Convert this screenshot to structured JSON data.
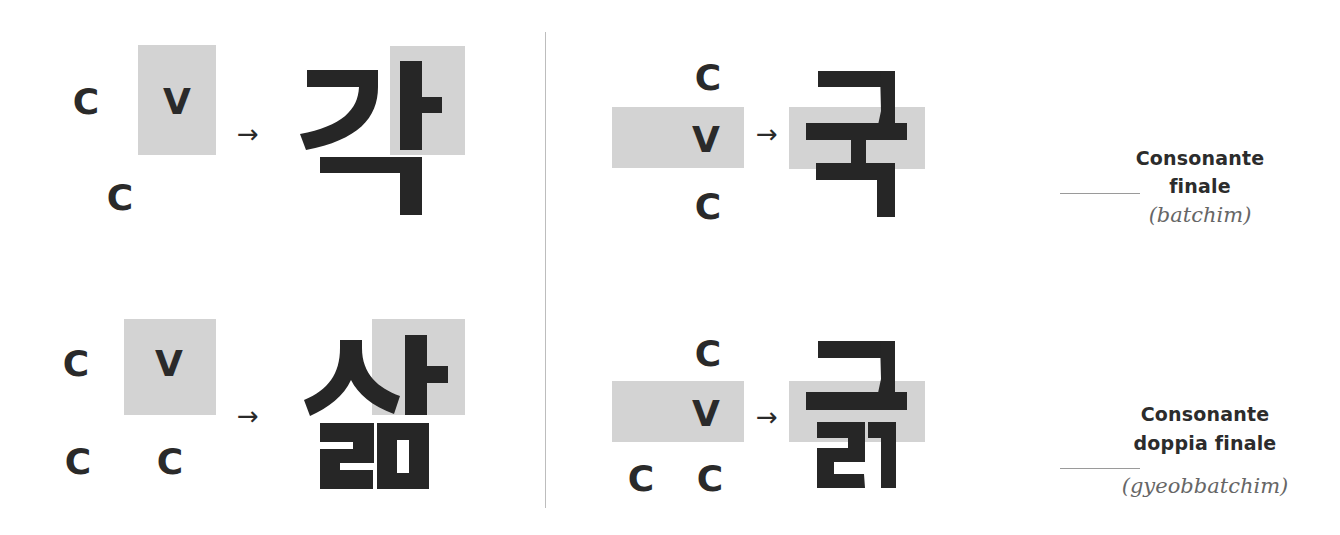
{
  "colors": {
    "ink": "#262626",
    "highlight_box": "#d3d3d3",
    "divider": "#bdbdbd",
    "italic_label": "#666666"
  },
  "panels": {
    "top_left": {
      "pattern": [
        "C",
        "V",
        "C"
      ],
      "letters": {
        "initial": "C",
        "vowel": "V",
        "final": "C"
      },
      "arrow": "→",
      "syllable": "각"
    },
    "bottom_left": {
      "pattern": [
        "C",
        "V",
        "C",
        "C"
      ],
      "letters": {
        "initial": "C",
        "vowel": "V",
        "final_1": "C",
        "final_2": "C"
      },
      "arrow": "→",
      "syllable": "삶"
    },
    "top_right": {
      "pattern": [
        "C",
        "V",
        "C"
      ],
      "letters": {
        "initial": "C",
        "vowel": "V",
        "final": "C"
      },
      "arrow": "→",
      "syllable": "국",
      "label": {
        "line1": "Consonante",
        "line2": "finale",
        "term": "(batchim)"
      }
    },
    "bottom_right": {
      "pattern": [
        "C",
        "V",
        "C",
        "C"
      ],
      "letters": {
        "initial": "C",
        "vowel": "V",
        "final_1": "C",
        "final_2": "C"
      },
      "arrow": "→",
      "syllable": "긁",
      "label": {
        "line1": "Consonante",
        "line2": "doppia finale",
        "term": "(gyeobbatchim)"
      }
    }
  }
}
